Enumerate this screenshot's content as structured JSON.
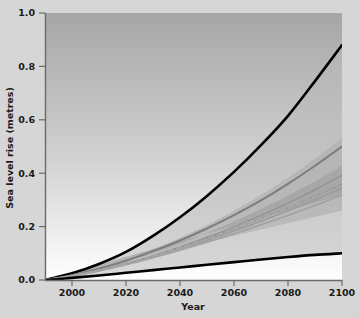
{
  "chart_data": {
    "type": "line",
    "title": "",
    "xlabel": "Year",
    "ylabel": "Sea level rise (metres)",
    "xlim": [
      1990,
      2100
    ],
    "ylim": [
      0.0,
      1.0
    ],
    "xticks": [
      2000,
      2020,
      2040,
      2060,
      2080,
      2100
    ],
    "xtick_labels": [
      "2000",
      "2020",
      "2040",
      "2060",
      "2080",
      "2100"
    ],
    "yticks": [
      0.0,
      0.2,
      0.4,
      0.6,
      0.8,
      1.0
    ],
    "ytick_labels": [
      "0.0",
      "0.2",
      "0.4",
      "0.6",
      "0.8",
      "1.0"
    ],
    "grid": false,
    "legend": "none",
    "x": [
      1990,
      2000,
      2010,
      2020,
      2030,
      2040,
      2050,
      2060,
      2070,
      2080,
      2090,
      2100
    ],
    "series": [
      {
        "name": "Upper envelope (all SRES, all models)",
        "style": "solid",
        "color": "#000000",
        "width": 2.6,
        "values": [
          0.0,
          0.025,
          0.06,
          0.105,
          0.165,
          0.235,
          0.315,
          0.405,
          0.505,
          0.615,
          0.745,
          0.88
        ]
      },
      {
        "name": "Model average A1FI",
        "style": "solid",
        "color": "#7d7d7d",
        "width": 2.0,
        "values": [
          0.0,
          0.018,
          0.042,
          0.072,
          0.108,
          0.148,
          0.193,
          0.243,
          0.298,
          0.36,
          0.428,
          0.5
        ]
      },
      {
        "name": "Model average A2",
        "style": "solid",
        "color": "#949494",
        "width": 1.5,
        "values": [
          0.0,
          0.016,
          0.037,
          0.062,
          0.091,
          0.124,
          0.16,
          0.199,
          0.242,
          0.288,
          0.338,
          0.392
        ]
      },
      {
        "name": "Model average A1B",
        "style": "solid",
        "color": "#8f8f8f",
        "width": 1.5,
        "values": [
          0.0,
          0.016,
          0.037,
          0.062,
          0.09,
          0.121,
          0.155,
          0.191,
          0.23,
          0.271,
          0.314,
          0.36
        ]
      },
      {
        "name": "Model average B2",
        "style": "solid",
        "color": "#9a9a9a",
        "width": 1.5,
        "values": [
          0.0,
          0.015,
          0.035,
          0.059,
          0.086,
          0.116,
          0.148,
          0.183,
          0.22,
          0.259,
          0.3,
          0.344
        ]
      },
      {
        "name": "Model average B1",
        "style": "solid",
        "color": "#a0a0a0",
        "width": 1.5,
        "values": [
          0.0,
          0.015,
          0.034,
          0.057,
          0.083,
          0.111,
          0.141,
          0.173,
          0.207,
          0.242,
          0.279,
          0.318
        ]
      },
      {
        "name": "Model average all SRES envelope (dashed)",
        "style": "dashed",
        "color": "#a6a6a6",
        "width": 2.4,
        "values": [
          0.0,
          0.015,
          0.036,
          0.061,
          0.089,
          0.12,
          0.154,
          0.191,
          0.23,
          0.272,
          0.316,
          0.365
        ]
      },
      {
        "name": "Lower envelope (all SRES, all models)",
        "style": "solid",
        "color": "#000000",
        "width": 2.6,
        "values": [
          0.0,
          0.008,
          0.017,
          0.027,
          0.037,
          0.047,
          0.057,
          0.067,
          0.077,
          0.086,
          0.094,
          0.1
        ]
      }
    ],
    "bands": [
      {
        "name": "All SRES envelope including land-ice uncertainties",
        "color": "#b8b8b8",
        "opacity": 0.55,
        "upper": [
          0.0,
          0.025,
          0.06,
          0.105,
          0.165,
          0.235,
          0.315,
          0.405,
          0.505,
          0.615,
          0.745,
          0.88
        ],
        "lower": [
          0.0,
          0.008,
          0.017,
          0.027,
          0.037,
          0.047,
          0.057,
          0.067,
          0.077,
          0.086,
          0.094,
          0.1
        ]
      },
      {
        "name": "Several models all SRES envelope",
        "color": "#ababab",
        "opacity": 0.6,
        "upper": [
          0.0,
          0.019,
          0.045,
          0.077,
          0.115,
          0.158,
          0.206,
          0.259,
          0.318,
          0.383,
          0.455,
          0.53
        ],
        "lower": [
          0.0,
          0.012,
          0.028,
          0.047,
          0.068,
          0.091,
          0.116,
          0.142,
          0.17,
          0.199,
          0.229,
          0.26
        ]
      },
      {
        "name": "Model average all SRES envelope",
        "color": "#9d9d9d",
        "opacity": 0.6,
        "upper": [
          0.0,
          0.017,
          0.04,
          0.068,
          0.1,
          0.136,
          0.176,
          0.219,
          0.266,
          0.316,
          0.37,
          0.428
        ],
        "lower": [
          0.0,
          0.014,
          0.033,
          0.055,
          0.08,
          0.108,
          0.138,
          0.17,
          0.204,
          0.24,
          0.277,
          0.318
        ]
      }
    ],
    "background": {
      "type": "vertical-gradient",
      "top_color": "#a6a6a6",
      "bottom_color": "#ffffff"
    },
    "figure_background": "#d6d6d6"
  }
}
